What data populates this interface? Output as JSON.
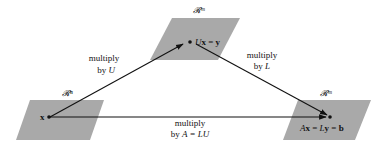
{
  "diagram": {
    "colors": {
      "plane": "#a9a9a9",
      "ink": "#111111",
      "background": "#ffffff"
    },
    "spaces": [
      {
        "id": "domain",
        "label": "𝓡ⁿ",
        "point_label": "x"
      },
      {
        "id": "middle",
        "label": "𝓡ᵐ",
        "point_label_parts": [
          "U",
          "x",
          " = ",
          "y"
        ]
      },
      {
        "id": "codomain",
        "label": "𝓡ᵐ",
        "point_label_parts": [
          "A",
          "x",
          " = ",
          "L",
          "y",
          " = ",
          "b"
        ]
      }
    ],
    "arrows": [
      {
        "id": "x-to-y",
        "line1": "multiply",
        "line2_prefix": "by ",
        "line2_var": "U"
      },
      {
        "id": "y-to-b",
        "line1": "multiply",
        "line2_prefix": "by ",
        "line2_var": "L"
      },
      {
        "id": "x-to-b",
        "line1": "multiply",
        "line2_prefix": "by ",
        "line2_var": "A = LU"
      }
    ]
  }
}
